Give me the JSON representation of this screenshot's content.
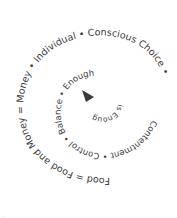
{
  "diagram": {
    "type": "text-spiral",
    "direction": "inward",
    "segments": [
      "Money and Food = Food",
      "= Money",
      "Individual",
      "Conscious Choice",
      "Contentment",
      "Control",
      "Balance",
      "Enough",
      "Enough is Enough"
    ],
    "outer_text": "Food = Food and Money = Money • Individual • Conscious Choice",
    "middle_text": "Contentment • Control • Balance • Enough",
    "inner_text": "is Enough",
    "spiral_text": "Money and Food = Food",
    "center_marker": "arrow",
    "text_color": "#3a3a3a",
    "footer_marks": ".."
  }
}
